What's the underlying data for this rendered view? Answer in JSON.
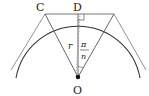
{
  "diagram": {
    "labels": {
      "C": "C",
      "D": "D",
      "O": "O",
      "radius": "r",
      "angle_numerator": "π",
      "angle_denominator": "n"
    },
    "colors": {
      "stroke": "#555555",
      "arc": "#333333",
      "point": "#111111",
      "text": "#222222"
    }
  }
}
